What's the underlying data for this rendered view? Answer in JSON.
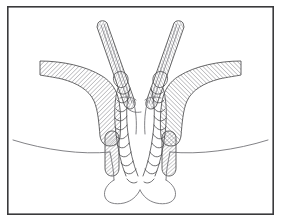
{
  "figure": {
    "title": "Surgical cross-section illustration",
    "style": "black-and-white hatched line art",
    "background_color": "#ffffff",
    "frame": {
      "name": "illustration-border",
      "stroke_color": "#3a3a3c",
      "stroke_width": 1.6,
      "x": 7,
      "y": 6,
      "width": 267,
      "height": 209
    },
    "colors": {
      "ink": "#4a4a4c",
      "hatch": "#6e6e73",
      "light_line": "#7b7b80",
      "fill": "#ffffff"
    },
    "elements": [
      {
        "id": "left-muscle-band",
        "label": "Left hatched muscle band",
        "fill_pattern": "diagonal-hatch",
        "position": "left flank, curving from outer edge down to midline"
      },
      {
        "id": "right-muscle-band",
        "label": "Right hatched muscle band",
        "fill_pattern": "diagonal-hatch",
        "position": "right flank, mirror of left band"
      },
      {
        "id": "left-instrument-rod",
        "label": "Left hatched instrument rod",
        "fill_pattern": "diagonal-hatch",
        "position": "enters from top-left, angles down-right toward midline"
      },
      {
        "id": "right-instrument-rod",
        "label": "Right hatched instrument rod",
        "fill_pattern": "diagonal-hatch",
        "position": "enters from top-right, angles down-left toward midline"
      },
      {
        "id": "left-braided-cord",
        "label": "Left braided suture cord",
        "fill_pattern": "twisted-rope",
        "position": "descends through midline left of center"
      },
      {
        "id": "right-braided-cord",
        "label": "Right braided suture cord",
        "fill_pattern": "twisted-rope",
        "position": "descends through midline right of center"
      },
      {
        "id": "left-lower-stub",
        "label": "Left lower hatched stub",
        "fill_pattern": "diagonal-hatch",
        "position": "short vertical element below left band"
      },
      {
        "id": "right-lower-stub",
        "label": "Right lower hatched stub",
        "fill_pattern": "diagonal-hatch",
        "position": "short vertical element below right band"
      },
      {
        "id": "skin-contour-line",
        "label": "Horizontal skin surface contour",
        "position": "sweeping curve across lower third"
      },
      {
        "id": "perineal-contour",
        "label": "Lower rounded perineal contour",
        "position": "U-shaped outline at bottom center"
      }
    ],
    "annotations": [],
    "labels": []
  }
}
